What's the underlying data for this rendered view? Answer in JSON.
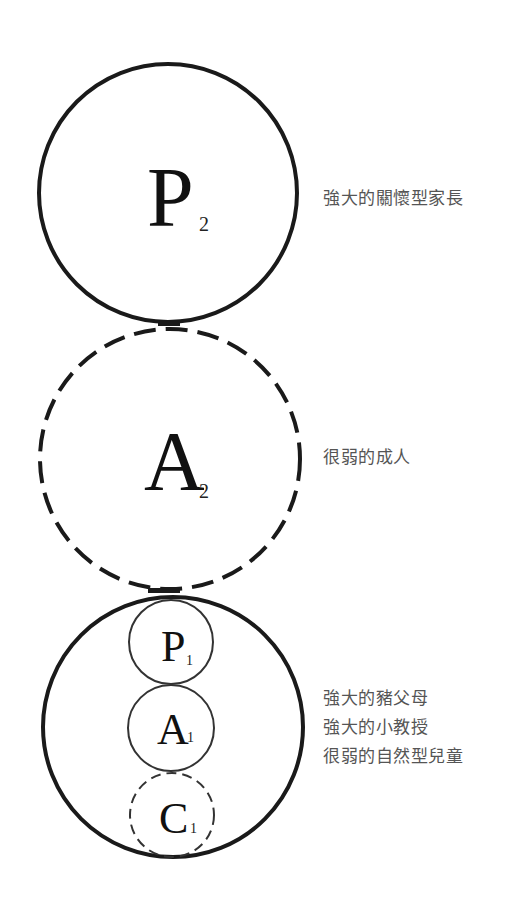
{
  "diagram": {
    "type": "second-order ego state structural model",
    "circles": {
      "parent2": {
        "letter": "P",
        "subscript": "2",
        "style": "solid"
      },
      "adult2": {
        "letter": "A",
        "subscript": "2",
        "style": "dashed"
      },
      "child2": {
        "style": "solid"
      },
      "parent1": {
        "letter": "P",
        "subscript": "1",
        "style": "solid"
      },
      "adult1": {
        "letter": "A",
        "subscript": "1",
        "style": "solid"
      },
      "child1": {
        "letter": "C",
        "subscript": "1",
        "style": "dashed"
      }
    },
    "labels": {
      "parent2": "強大的關懷型家長",
      "adult2": "很弱的成人",
      "child2": [
        "強大的豬父母",
        "強大的小教授",
        "很弱的自然型兒童"
      ]
    },
    "colors": {
      "stroke": "#1a1a1a",
      "label_text": "#555555",
      "background": "#ffffff"
    }
  }
}
